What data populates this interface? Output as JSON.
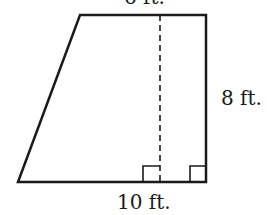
{
  "diagram": {
    "shape": "trapezoid",
    "labels": {
      "top": "6 ft.",
      "right": "8 ft.",
      "bottom": "10 ft."
    },
    "vertices": {
      "top_left": [
        80,
        15
      ],
      "top_right": [
        206,
        15
      ],
      "bottom_right": [
        206,
        182
      ],
      "bottom_left": [
        18,
        182
      ]
    },
    "height_line": {
      "x": 160,
      "style": "dashed"
    },
    "right_angle_markers": 2,
    "stroke_color": "#1a1a1a"
  }
}
